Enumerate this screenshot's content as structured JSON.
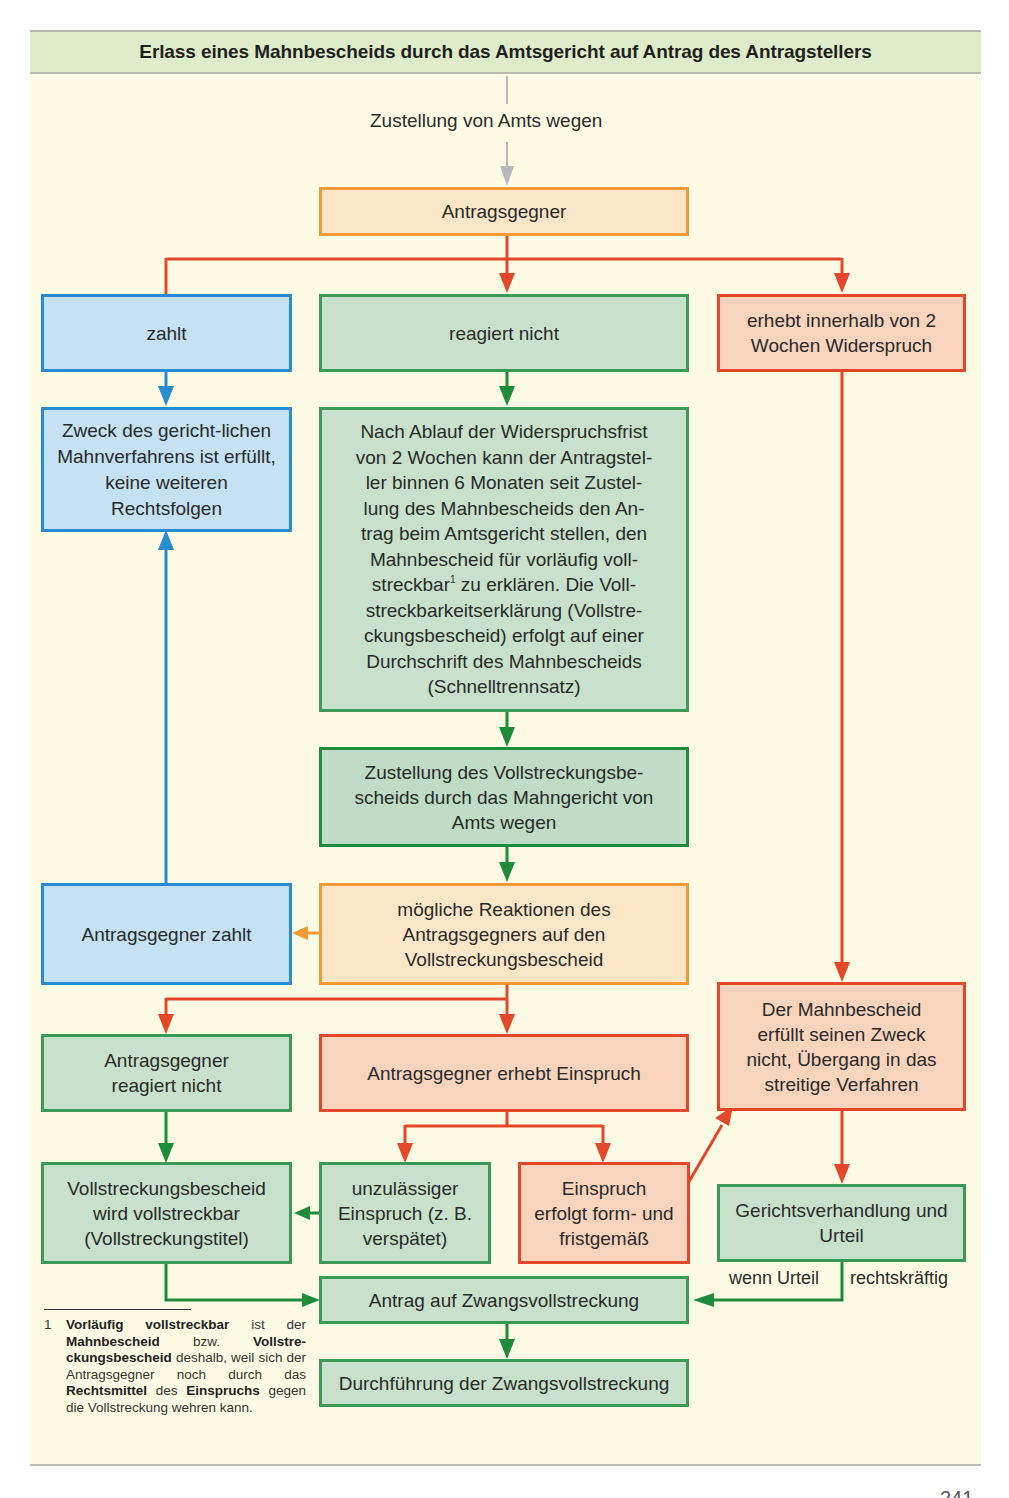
{
  "header": {
    "title": "Erlass eines Mahnbescheids durch das Amtsgericht auf Antrag des Antragstellers"
  },
  "labels": {
    "service": "Zustellung von Amts wegen",
    "if_judgment": "wenn Urteil",
    "final": "rechtskräftig"
  },
  "boxes": {
    "respondent": "Antragsgegner",
    "pays": "zahlt",
    "no_reaction": "reagiert nicht",
    "objection": "erhebt innerhalb von 2 Wochen Widerspruch",
    "purpose_fulfilled": "Zweck des gericht-lichen Mahnverfahrens ist erfüllt, keine weiteren Rechtsfolgen",
    "after_deadline_lines": [
      "Nach Ablauf der Widerspruchsfrist",
      "von 2 Wochen kann der Antragstel-",
      "ler binnen 6 Monaten seit Zustel-",
      "lung des Mahnbescheids den An-",
      "trag beim Amtsgericht stellen, den",
      "Mahnbescheid für vorläufig voll-",
      "streckbar",
      "zu erklären. Die Voll-",
      "streckbarkeitserklärung (Vollstre-",
      "ckungsbescheid) erfolgt auf einer",
      "Durchschrift des Mahnbescheids",
      "(Schnelltrennsatz)"
    ],
    "footnote_marker": "1",
    "delivery_enforcement": "Zustellung des Vollstreckungsbe-scheids durch das Mahngericht von Amts wegen",
    "respondent_pays": "Antragsgegner zahlt",
    "possible_reactions": "mögliche Reaktionen des Antragsgegners auf den Vollstreckungsbescheid",
    "not_fulfilled": "Der Mahnbescheid erfüllt seinen Zweck nicht, Übergang in das streitige Verfahren",
    "respondent_no_reaction": "Antragsgegner reagiert nicht",
    "respondent_appeals": "Antragsgegner erhebt Einspruch",
    "enforceable": "Vollstreckungsbescheid wird vollstreckbar (Vollstreckungstitel)",
    "inadmissible": "unzulässiger Einspruch (z. B. verspätet)",
    "proper_appeal": "Einspruch erfolgt form- und fristgemäß",
    "court_hearing": "Gerichtsverhandlung und Urteil",
    "enforcement_request": "Antrag auf Zwangsvollstreckung",
    "enforcement_execution": "Durchführung der Zwangsvollstreckung"
  },
  "footnote": {
    "number": "1",
    "parts": [
      {
        "t": "Vorläufig vollstreckbar",
        "b": true
      },
      {
        "t": " ist der ",
        "b": false
      },
      {
        "t": "Mahnbescheid",
        "b": true
      },
      {
        "t": " bzw. ",
        "b": false
      },
      {
        "t": "Vollstre­ckungsbescheid",
        "b": true
      },
      {
        "t": " deshalb, weil sich der Antragsgegner noch durch das ",
        "b": false
      },
      {
        "t": "Rechtsmittel",
        "b": true
      },
      {
        "t": " des ",
        "b": false
      },
      {
        "t": "Einspruchs",
        "b": true
      },
      {
        "t": " gegen die Vollstre­ckung wehren kann.",
        "b": false
      }
    ]
  },
  "page": {
    "number": "241"
  },
  "colors": {
    "panel_bg": "#fefbe4",
    "header_bg": "#dfecc9",
    "blue": "#2a8bd3",
    "green": "#1f8c3b",
    "orange": "#f29a35",
    "red": "#e5472a",
    "gray_arrow": "#b8b8c0"
  }
}
